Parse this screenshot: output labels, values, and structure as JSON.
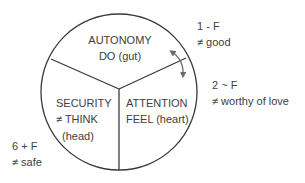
{
  "colors": {
    "background": "#ffffff",
    "line": "#3a3a3a",
    "text": "#404040",
    "arrow": "#6b6b6b"
  },
  "segments": {
    "top": {
      "title": "AUTONOMY",
      "subtitle": "DO (gut)"
    },
    "left": {
      "title": "SECURITY",
      "subtitle": "≠ THINK",
      "subtitle2": "(head)"
    },
    "right": {
      "title": "ATTENTION",
      "subtitle": "FEEL (heart)"
    }
  },
  "annotations": {
    "one": {
      "line1": "1 - F",
      "line2": "≠ good"
    },
    "two": {
      "line1": "2 ~ F",
      "line2": "≠ worthy of love"
    },
    "six": {
      "line1": "6 + F",
      "line2": "≠ safe"
    }
  },
  "icons": {
    "double_arrow": "curved-double-arrow-icon"
  }
}
